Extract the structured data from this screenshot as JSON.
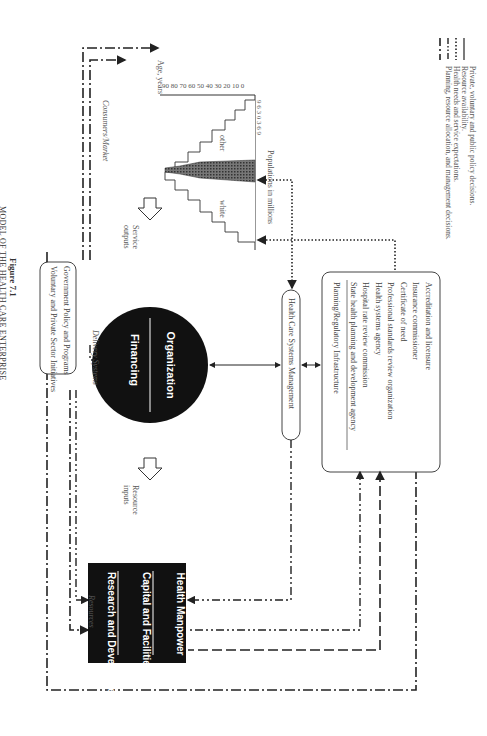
{
  "figure": {
    "number": "Figure 7.1",
    "title": "MODEL OF THE HEALTH CARE ENTERPRISE"
  },
  "government_box": {
    "line1": "Government Policy and Programs",
    "line2": "Voluntary and Private Sector Initiatives"
  },
  "labels": {
    "resources": "Resources",
    "resource_inputs_1": "Resource",
    "resource_inputs_2": "inputs",
    "delivery_systems": "Delivery Systems",
    "service_outputs_1": "Service",
    "service_outputs_2": "outputs",
    "consumers_market": "Consumers/Market"
  },
  "resources_block": {
    "items": [
      "Research and Development",
      "Capital and Facilities",
      "Health Manpower"
    ]
  },
  "delivery_circle": {
    "top": "Financing",
    "bottom": "Organization"
  },
  "management_box": {
    "label": "Health Care Systems Management"
  },
  "planning_box": {
    "title": "Planning/Regulatory Infrastructure",
    "items": [
      "Accreditation and licensure",
      "Insurance commissioner",
      "Certificate of need",
      "Professional standards review organization",
      "Health systems agency",
      "Hospital rate review commission",
      "State health planning and development agency"
    ]
  },
  "pyramid": {
    "x_label": "Populations in millions",
    "y_label": "Age, years",
    "x_ticks": [
      "9",
      "6",
      "3",
      "0",
      "3",
      "6",
      "9"
    ],
    "y_ticks": [
      "90",
      "80",
      "70",
      "60",
      "50",
      "40",
      "30",
      "20",
      "10",
      "0"
    ],
    "series_white": "white",
    "series_other": "other"
  },
  "legend": {
    "items": [
      {
        "style": "dash-dot",
        "label": "Private, voluntary and public policy decisions."
      },
      {
        "style": "dash-dot-dot",
        "label": "Resource availability."
      },
      {
        "style": "dotted",
        "label": "Health needs and service expectations."
      },
      {
        "style": "solid",
        "label": "Planning, resource allocation, and management decisions."
      }
    ]
  }
}
